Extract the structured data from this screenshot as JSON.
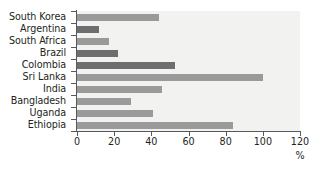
{
  "chart_data": {
    "type": "bar",
    "orientation": "horizontal",
    "title": "",
    "xlabel": "%",
    "ylabel": "",
    "xlim": [
      0,
      120
    ],
    "xticks": [
      0,
      20,
      40,
      60,
      80,
      100,
      120
    ],
    "xtick_labels": [
      "0",
      "20",
      "40",
      "60",
      "80",
      "100",
      "120"
    ],
    "grid": false,
    "legend": null,
    "categories": [
      "South Korea",
      "Argentina",
      "South Africa",
      "Brazil",
      "Colombia",
      "Sri Lanka",
      "India",
      "Bangladesh",
      "Uganda",
      "Ethiopia"
    ],
    "values": [
      44,
      12,
      17,
      22,
      53,
      100,
      46,
      29,
      41,
      84
    ],
    "bar_colors": [
      "#9a9a9a",
      "#6e6e6e",
      "#9a9a9a",
      "#6e6e6e",
      "#6e6e6e",
      "#9a9a9a",
      "#9a9a9a",
      "#9a9a9a",
      "#9a9a9a",
      "#9a9a9a"
    ],
    "bars": [
      {
        "category": "South Korea",
        "value": 44,
        "color": "#9a9a9a"
      },
      {
        "category": "Argentina",
        "value": 12,
        "color": "#6e6e6e"
      },
      {
        "category": "South Africa",
        "value": 17,
        "color": "#9a9a9a"
      },
      {
        "category": "Brazil",
        "value": 22,
        "color": "#6e6e6e"
      },
      {
        "category": "Colombia",
        "value": 53,
        "color": "#6e6e6e"
      },
      {
        "category": "Sri Lanka",
        "value": 100,
        "color": "#9a9a9a"
      },
      {
        "category": "India",
        "value": 46,
        "color": "#9a9a9a"
      },
      {
        "category": "Bangladesh",
        "value": 29,
        "color": "#9a9a9a"
      },
      {
        "category": "Uganda",
        "value": 41,
        "color": "#9a9a9a"
      },
      {
        "category": "Ethiopia",
        "value": 84,
        "color": "#9a9a9a"
      }
    ],
    "colors": {
      "plot_background": "#f2f2f0",
      "page_background": "#ffffff",
      "axis": "#58595b",
      "text": "#231f20",
      "bar_light": "#9a9a9a",
      "bar_dark": "#6e6e6e"
    }
  }
}
